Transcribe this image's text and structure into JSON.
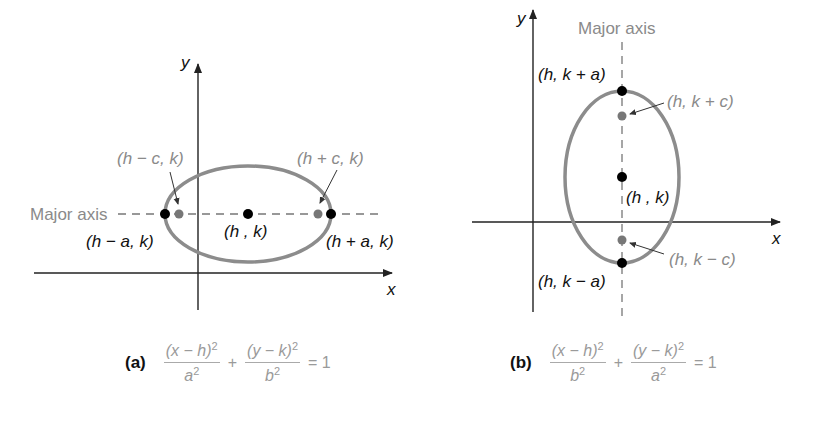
{
  "figure_a": {
    "tag": "(a)",
    "axis_x_label": "x",
    "axis_y_label": "y",
    "major_axis_label": "Major axis",
    "points": {
      "center": "(h , k)",
      "vertex_left": "(h − a, k)",
      "vertex_right": "(h + a, k)",
      "focus_left": "(h − c, k)",
      "focus_right": "(h + c, k)"
    },
    "equation": {
      "term1_num": "(x − h)",
      "term1_den": "a",
      "term2_num": "(y − k)",
      "term2_den": "b",
      "exp": "2",
      "plus": "+",
      "equals": "= 1"
    }
  },
  "figure_b": {
    "tag": "(b)",
    "axis_x_label": "x",
    "axis_y_label": "y",
    "major_axis_label": "Major axis",
    "points": {
      "center": "(h , k)",
      "vertex_top": "(h, k + a)",
      "vertex_bottom": "(h, k − a)",
      "focus_top": "(h, k + c)",
      "focus_bottom": "(h, k − c)"
    },
    "equation": {
      "term1_num": "(x − h)",
      "term1_den": "b",
      "term2_num": "(y − k)",
      "term2_den": "a",
      "exp": "2",
      "plus": "+",
      "equals": "= 1"
    }
  },
  "colors": {
    "ellipse": "#8c8c8c",
    "vertex_dot": "#000000",
    "focus_dot": "#777777",
    "axis": "#222222",
    "gray_text": "#8a8a8a"
  }
}
